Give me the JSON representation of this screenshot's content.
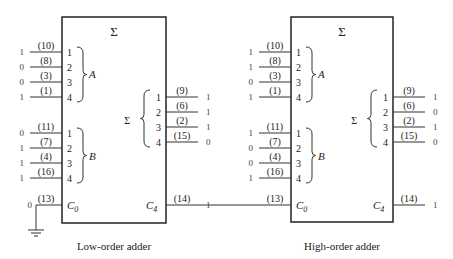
{
  "sum_symbol": "Σ",
  "adders": [
    {
      "caption": "Low-order adder",
      "title": "Σ",
      "a_label": "A",
      "b_label": "B",
      "sum_label": "Σ",
      "a_inputs": [
        {
          "pin": "1",
          "pin_no": "(10)",
          "value": "1"
        },
        {
          "pin": "2",
          "pin_no": "(8)",
          "value": "0"
        },
        {
          "pin": "3",
          "pin_no": "(3)",
          "value": "0"
        },
        {
          "pin": "4",
          "pin_no": "(1)",
          "value": "1"
        }
      ],
      "b_inputs": [
        {
          "pin": "1",
          "pin_no": "(11)",
          "value": "0"
        },
        {
          "pin": "2",
          "pin_no": "(7)",
          "value": "1"
        },
        {
          "pin": "3",
          "pin_no": "(4)",
          "value": "1"
        },
        {
          "pin": "4",
          "pin_no": "(16)",
          "value": "1"
        }
      ],
      "sum_outputs": [
        {
          "pin": "1",
          "pin_no": "(9)",
          "value": "1"
        },
        {
          "pin": "2",
          "pin_no": "(6)",
          "value": "1"
        },
        {
          "pin": "3",
          "pin_no": "(2)",
          "value": "1"
        },
        {
          "pin": "4",
          "pin_no": "(15)",
          "value": "0"
        }
      ],
      "carry_in": {
        "label": "C",
        "sub": "0",
        "pin_no": "(13)",
        "value": "0"
      },
      "carry_out": {
        "label": "C",
        "sub": "4",
        "pin_no": "(14)",
        "value": "1"
      }
    },
    {
      "caption": "High-order adder",
      "title": "Σ",
      "a_label": "A",
      "b_label": "B",
      "sum_label": "Σ",
      "a_inputs": [
        {
          "pin": "1",
          "pin_no": "(10)",
          "value": "1"
        },
        {
          "pin": "2",
          "pin_no": "(8)",
          "value": "1"
        },
        {
          "pin": "3",
          "pin_no": "(3)",
          "value": "0"
        },
        {
          "pin": "4",
          "pin_no": "(1)",
          "value": "1"
        }
      ],
      "b_inputs": [
        {
          "pin": "1",
          "pin_no": "(11)",
          "value": "1"
        },
        {
          "pin": "2",
          "pin_no": "(7)",
          "value": "0"
        },
        {
          "pin": "3",
          "pin_no": "(4)",
          "value": "0"
        },
        {
          "pin": "4",
          "pin_no": "(16)",
          "value": "1"
        }
      ],
      "sum_outputs": [
        {
          "pin": "1",
          "pin_no": "(9)",
          "value": "1"
        },
        {
          "pin": "2",
          "pin_no": "(6)",
          "value": "0"
        },
        {
          "pin": "3",
          "pin_no": "(2)",
          "value": "1"
        },
        {
          "pin": "4",
          "pin_no": "(15)",
          "value": "0"
        }
      ],
      "carry_in": {
        "label": "C",
        "sub": "0",
        "pin_no": "(13)",
        "value": ""
      },
      "carry_out": {
        "label": "C",
        "sub": "4",
        "pin_no": "(14)",
        "value": "1"
      }
    }
  ]
}
